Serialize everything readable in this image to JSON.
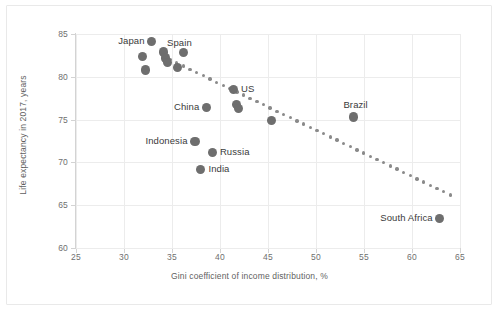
{
  "chart_data": {
    "type": "scatter",
    "title": "",
    "xlabel": "Gini coefficient of income distribution, %",
    "ylabel": "Life expectancy in 2017, years",
    "xlim": [
      25,
      65
    ],
    "ylim": [
      60,
      85
    ],
    "xticks": [
      "25",
      "30",
      "35",
      "40",
      "45",
      "50",
      "55",
      "60",
      "65"
    ],
    "yticks": [
      "60",
      "65",
      "70",
      "75",
      "80",
      "85"
    ],
    "grid": true,
    "legend": "none",
    "marker_color": "#6e6e6e",
    "trendline_color": "#8a8a8a",
    "trendline_style": "dotted",
    "points": [
      {
        "label": "Japan",
        "x": 32.9,
        "y": 84.1,
        "label_pos": "left"
      },
      {
        "label": "",
        "x": 31.9,
        "y": 82.4,
        "label_pos": "none"
      },
      {
        "label": "",
        "x": 32.2,
        "y": 80.8,
        "label_pos": "none"
      },
      {
        "label": "",
        "x": 34.1,
        "y": 82.9,
        "label_pos": "none"
      },
      {
        "label": "",
        "x": 34.3,
        "y": 82.2,
        "label_pos": "none"
      },
      {
        "label": "",
        "x": 34.5,
        "y": 81.7,
        "label_pos": "none"
      },
      {
        "label": "Spain",
        "x": 36.2,
        "y": 82.8,
        "label_pos": "topleft"
      },
      {
        "label": "",
        "x": 35.6,
        "y": 81.1,
        "label_pos": "none"
      },
      {
        "label": "US",
        "x": 41.4,
        "y": 78.5,
        "label_pos": "right"
      },
      {
        "label": "",
        "x": 41.7,
        "y": 76.8,
        "label_pos": "none"
      },
      {
        "label": "",
        "x": 41.9,
        "y": 76.3,
        "label_pos": "none"
      },
      {
        "label": "China",
        "x": 38.6,
        "y": 76.4,
        "label_pos": "left"
      },
      {
        "label": "",
        "x": 45.4,
        "y": 74.9,
        "label_pos": "none"
      },
      {
        "label": "Indonesia",
        "x": 37.4,
        "y": 72.4,
        "label_pos": "left"
      },
      {
        "label": "Russia",
        "x": 39.2,
        "y": 71.2,
        "label_pos": "right"
      },
      {
        "label": "India",
        "x": 38.0,
        "y": 69.2,
        "label_pos": "right"
      },
      {
        "label": "Brazil",
        "x": 53.9,
        "y": 75.3,
        "label_pos": "top"
      },
      {
        "label": "South Africa",
        "x": 62.9,
        "y": 63.4,
        "label_pos": "left"
      }
    ],
    "trendline": {
      "description": "dotted downward trend from upper left to lower right",
      "start": {
        "x": 34.8,
        "y": 82.0
      },
      "end": {
        "x": 64.0,
        "y": 66.2
      }
    }
  }
}
